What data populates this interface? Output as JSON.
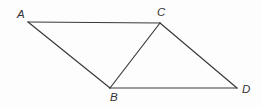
{
  "figure": {
    "background_color": "#fdfdfd",
    "stroke_color": "#3a3a3a",
    "label_color": "#333333",
    "stroke_width": 1.2,
    "width": 261,
    "height": 107,
    "points": [
      {
        "id": "A",
        "label": "A",
        "x": 28,
        "y": 22,
        "label_x": 17,
        "label_y": 9
      },
      {
        "id": "C",
        "label": "C",
        "x": 160,
        "y": 23,
        "label_x": 157,
        "label_y": 7
      },
      {
        "id": "B",
        "label": "B",
        "x": 110,
        "y": 88,
        "label_x": 110,
        "label_y": 92
      },
      {
        "id": "D",
        "label": "D",
        "x": 237,
        "y": 88,
        "label_x": 242,
        "label_y": 84
      }
    ],
    "segments": [
      {
        "id": "AC",
        "from": "A",
        "to": "C",
        "x1": 28,
        "y1": 22,
        "x2": 160,
        "y2": 23
      },
      {
        "id": "AB",
        "from": "A",
        "to": "B",
        "x1": 28,
        "y1": 22,
        "x2": 110,
        "y2": 88
      },
      {
        "id": "BC",
        "from": "B",
        "to": "C",
        "x1": 110,
        "y1": 88,
        "x2": 160,
        "y2": 23
      },
      {
        "id": "CD",
        "from": "C",
        "to": "D",
        "x1": 160,
        "y1": 23,
        "x2": 237,
        "y2": 88
      },
      {
        "id": "BD",
        "from": "B",
        "to": "D",
        "x1": 110,
        "y1": 88,
        "x2": 237,
        "y2": 88
      }
    ]
  }
}
